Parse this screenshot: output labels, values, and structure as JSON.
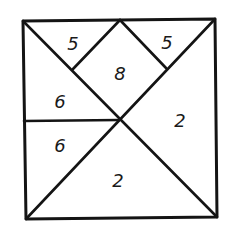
{
  "diagram": {
    "type": "tangram-square-partition",
    "line_color": "#141414",
    "background": "#ffffff",
    "square": {
      "corners": {
        "top_left": [
          23,
          21
        ],
        "top_right": [
          215,
          19
        ],
        "bottom_right": [
          217,
          217
        ],
        "bottom_left": [
          26,
          219
        ]
      }
    },
    "points": {
      "top_mid": [
        120,
        20
      ],
      "center": [
        119,
        120
      ],
      "left_mid": [
        24,
        121
      ],
      "upper_left_joint": [
        73,
        69
      ],
      "upper_right_joint": [
        166,
        68
      ]
    },
    "segments": [
      {
        "name": "diagonal-tl-br",
        "from": "top_left",
        "to": "bottom_right"
      },
      {
        "name": "diagonal-bl-tr",
        "from": "bottom_left",
        "to": "top_right"
      },
      {
        "name": "midline-left",
        "from": "left_mid",
        "to": "center"
      },
      {
        "name": "top-left-small-edge",
        "from": "top_mid",
        "to": "upper_left_joint"
      },
      {
        "name": "top-right-small-edge",
        "from": "top_mid",
        "to": "upper_right_joint"
      }
    ],
    "regions": [
      {
        "id": "top-left-small-triangle",
        "label": "5",
        "pos": [
          73,
          44
        ]
      },
      {
        "id": "top-right-small-triangle",
        "label": "5",
        "pos": [
          167,
          43
        ]
      },
      {
        "id": "middle-square",
        "label": "8",
        "pos": [
          120,
          74
        ]
      },
      {
        "id": "left-upper-triangle",
        "label": "6",
        "pos": [
          60,
          102
        ]
      },
      {
        "id": "left-lower-triangle",
        "label": "6",
        "pos": [
          60,
          146
        ]
      },
      {
        "id": "right-large-triangle",
        "label": "2",
        "pos": [
          180,
          121
        ]
      },
      {
        "id": "bottom-large-triangle",
        "label": "2",
        "pos": [
          118,
          181
        ]
      }
    ]
  }
}
